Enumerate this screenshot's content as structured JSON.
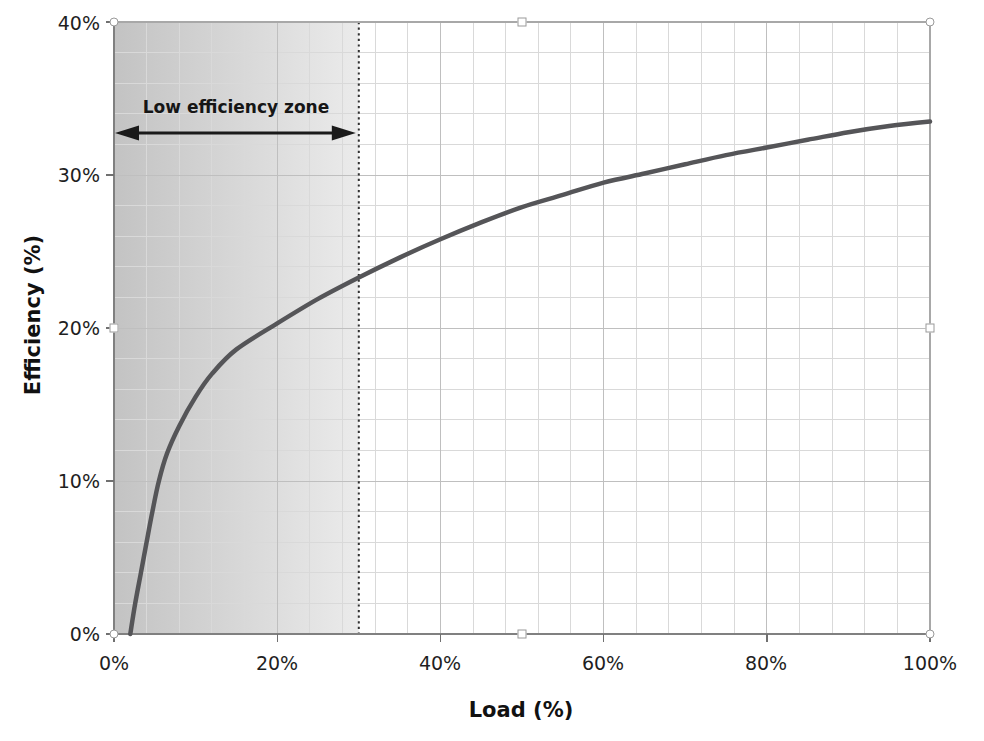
{
  "chart_data": {
    "type": "line",
    "title": "",
    "xlabel": "Load (%)",
    "ylabel": "Efficiency (%)",
    "xlim": [
      0,
      100
    ],
    "ylim": [
      0,
      40
    ],
    "x_tick_labels": [
      "0%",
      "20%",
      "40%",
      "60%",
      "80%",
      "100%"
    ],
    "x_tick_values": [
      0,
      20,
      40,
      60,
      80,
      100
    ],
    "y_tick_labels": [
      "0%",
      "10%",
      "20%",
      "30%",
      "40%"
    ],
    "y_tick_values": [
      0,
      10,
      20,
      30,
      40
    ],
    "x_minor_step": 4,
    "y_minor_step": 2,
    "grid": "on",
    "legend": "none",
    "series": [
      {
        "name": "Efficiency vs Load",
        "color": "#555558",
        "x": [
          2,
          2.6,
          3.3,
          4,
          4.7,
          5.5,
          6.5,
          8,
          10,
          12,
          15,
          20,
          25,
          30,
          35,
          40,
          45,
          50,
          55,
          60,
          65,
          70,
          75,
          80,
          85,
          90,
          95,
          100
        ],
        "y": [
          0,
          2,
          4,
          6,
          8,
          10,
          11.8,
          13.6,
          15.5,
          17,
          18.6,
          20.3,
          21.9,
          23.3,
          24.6,
          25.8,
          26.9,
          27.9,
          28.7,
          29.5,
          30.1,
          30.7,
          31.3,
          31.8,
          32.3,
          32.8,
          33.2,
          33.5
        ]
      }
    ],
    "annotations": {
      "zone_label": "Low efficiency zone",
      "zone_range": [
        0,
        30
      ],
      "zone_arrow": "double-headed",
      "threshold_x": 30,
      "threshold_style": "dotted"
    },
    "colors": {
      "curve": "#555558",
      "grid_minor": "#d9d9d9",
      "grid_major": "#bfbfbf",
      "axis_line": "#808080",
      "plot_border": "#a8a8a8",
      "tick_mark": "#707070",
      "zone_gradient_start": "#c3c3c3",
      "zone_gradient_mid": "#d9d9d9",
      "zone_gradient_end": "#ebebeb",
      "threshold_line": "#303030",
      "annotation_ink": "#1a1a1a",
      "text": "#1f1f1f"
    }
  }
}
